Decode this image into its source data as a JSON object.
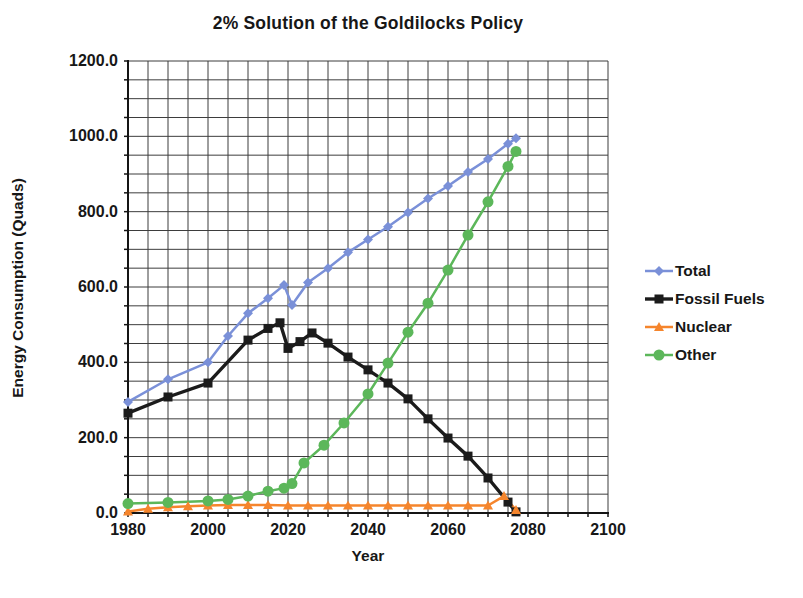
{
  "title": "2% Solution of the Goldilocks Policy",
  "chart_data": {
    "type": "line",
    "title": "2% Solution of the Goldilocks Policy",
    "xlabel": "Year",
    "ylabel": "Energy Consumption (Quads)",
    "xlim": [
      1980,
      2100
    ],
    "ylim": [
      0,
      1200
    ],
    "x_ticks": [
      {
        "label": "1980",
        "value": 1980
      },
      {
        "label": "2000",
        "value": 2000
      },
      {
        "label": "2020",
        "value": 2020
      },
      {
        "label": "2040",
        "value": 2040
      },
      {
        "label": "2060",
        "value": 2060
      },
      {
        "label": "2080",
        "value": 2080
      },
      {
        "label": "2100",
        "value": 2100
      }
    ],
    "y_ticks": [
      {
        "label": "1200.0",
        "value": 1200
      },
      {
        "label": "1000.0",
        "value": 1000
      },
      {
        "label": "800.0",
        "value": 800
      },
      {
        "label": "600.0",
        "value": 600
      },
      {
        "label": "400.0",
        "value": 400
      },
      {
        "label": "200.0",
        "value": 200
      },
      {
        "label": "0.0",
        "value": 0
      }
    ],
    "grid": {
      "on": true,
      "x_step_years": 5,
      "y_step_quads": 50
    },
    "legend_position": "right",
    "series": [
      {
        "name": "Total",
        "color": "#7a90d8",
        "marker": "diamond",
        "line_width": 2.5,
        "points": [
          [
            1980,
            295
          ],
          [
            1990,
            355
          ],
          [
            2000,
            400
          ],
          [
            2005,
            470
          ],
          [
            2010,
            530
          ],
          [
            2015,
            570
          ],
          [
            2019,
            605
          ],
          [
            2021,
            552
          ],
          [
            2025,
            612
          ],
          [
            2030,
            650
          ],
          [
            2035,
            692
          ],
          [
            2040,
            726
          ],
          [
            2045,
            760
          ],
          [
            2050,
            798
          ],
          [
            2055,
            835
          ],
          [
            2060,
            868
          ],
          [
            2065,
            905
          ],
          [
            2070,
            940
          ],
          [
            2075,
            980
          ],
          [
            2077,
            995
          ]
        ]
      },
      {
        "name": "Fossil Fuels",
        "color": "#1b1b1b",
        "marker": "square",
        "line_width": 3.4,
        "points": [
          [
            1980,
            265
          ],
          [
            1990,
            308
          ],
          [
            2000,
            345
          ],
          [
            2010,
            459
          ],
          [
            2015,
            490
          ],
          [
            2018,
            505
          ],
          [
            2020,
            437
          ],
          [
            2023,
            455
          ],
          [
            2026,
            478
          ],
          [
            2030,
            451
          ],
          [
            2035,
            414
          ],
          [
            2040,
            380
          ],
          [
            2045,
            345
          ],
          [
            2050,
            303
          ],
          [
            2055,
            250
          ],
          [
            2060,
            199
          ],
          [
            2065,
            151
          ],
          [
            2070,
            93
          ],
          [
            2075,
            29
          ],
          [
            2077,
            3
          ]
        ]
      },
      {
        "name": "Nuclear",
        "color": "#f5852c",
        "marker": "triangle",
        "line_width": 2.5,
        "points": [
          [
            1980,
            4
          ],
          [
            1985,
            11
          ],
          [
            1990,
            15
          ],
          [
            1995,
            18
          ],
          [
            2000,
            20
          ],
          [
            2005,
            21
          ],
          [
            2010,
            21
          ],
          [
            2015,
            21
          ],
          [
            2020,
            20
          ],
          [
            2025,
            20
          ],
          [
            2030,
            20
          ],
          [
            2035,
            20
          ],
          [
            2040,
            20
          ],
          [
            2045,
            20
          ],
          [
            2050,
            20
          ],
          [
            2055,
            20
          ],
          [
            2060,
            20
          ],
          [
            2065,
            20
          ],
          [
            2070,
            20
          ],
          [
            2074,
            45
          ],
          [
            2077,
            8
          ]
        ]
      },
      {
        "name": "Other",
        "color": "#5cb75a",
        "marker": "circle",
        "line_width": 2.5,
        "points": [
          [
            1980,
            25
          ],
          [
            1990,
            28
          ],
          [
            2000,
            32
          ],
          [
            2005,
            36
          ],
          [
            2010,
            45
          ],
          [
            2015,
            58
          ],
          [
            2019,
            66
          ],
          [
            2021,
            78
          ],
          [
            2024,
            133
          ],
          [
            2029,
            180
          ],
          [
            2034,
            239
          ],
          [
            2040,
            316
          ],
          [
            2045,
            398
          ],
          [
            2050,
            480
          ],
          [
            2055,
            557
          ],
          [
            2060,
            645
          ],
          [
            2065,
            738
          ],
          [
            2070,
            826
          ],
          [
            2075,
            920
          ],
          [
            2077,
            960
          ]
        ]
      }
    ]
  }
}
